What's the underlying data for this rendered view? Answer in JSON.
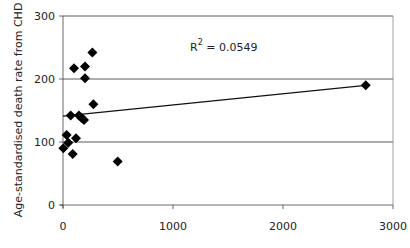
{
  "chart_data": {
    "type": "scatter",
    "title": "",
    "xlabel": "",
    "ylabel": "Age-standardised death rate from CHD",
    "xlim": [
      0,
      3000
    ],
    "ylim": [
      0,
      300
    ],
    "x_ticks": [
      0,
      1000,
      2000,
      3000
    ],
    "y_ticks": [
      0,
      100,
      200,
      300
    ],
    "grid": {
      "horizontal": true,
      "vertical": false
    },
    "legend": null,
    "marker": "diamond",
    "series": [
      {
        "name": "countries",
        "points": [
          {
            "x": 3,
            "y": 90
          },
          {
            "x": 33,
            "y": 111
          },
          {
            "x": 48,
            "y": 99
          },
          {
            "x": 88,
            "y": 81
          },
          {
            "x": 118,
            "y": 106
          },
          {
            "x": 70,
            "y": 142
          },
          {
            "x": 145,
            "y": 142
          },
          {
            "x": 170,
            "y": 138
          },
          {
            "x": 191,
            "y": 135
          },
          {
            "x": 276,
            "y": 160
          },
          {
            "x": 100,
            "y": 217
          },
          {
            "x": 200,
            "y": 220
          },
          {
            "x": 200,
            "y": 201
          },
          {
            "x": 267,
            "y": 242
          },
          {
            "x": 497,
            "y": 69
          },
          {
            "x": 2752,
            "y": 190
          }
        ]
      }
    ],
    "trendline": {
      "type": "linear",
      "x0": 0,
      "y0": 141,
      "x1": 2752,
      "y1": 190
    },
    "annotations": [
      {
        "text": "R",
        "sup": "2",
        "rest": " = 0.0549",
        "x": 1150,
        "y": 238
      }
    ]
  },
  "labels": {
    "ylabel": "Age-standardised death rate from CHD",
    "r2_base": "R",
    "r2_sup": "2",
    "r2_rest": " = 0.0549"
  }
}
